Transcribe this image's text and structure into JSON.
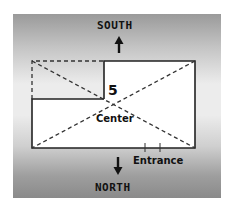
{
  "diagram": {
    "top_direction": "SOUTH",
    "bottom_direction": "NORTH",
    "room_number": "5",
    "center_label": "Center",
    "entrance_label": "Entrance",
    "icons": {
      "up_arrow": "arrow-up-icon",
      "down_arrow": "arrow-down-icon"
    },
    "colors": {
      "line": "#222222",
      "room_fill": "#ffffff"
    }
  }
}
